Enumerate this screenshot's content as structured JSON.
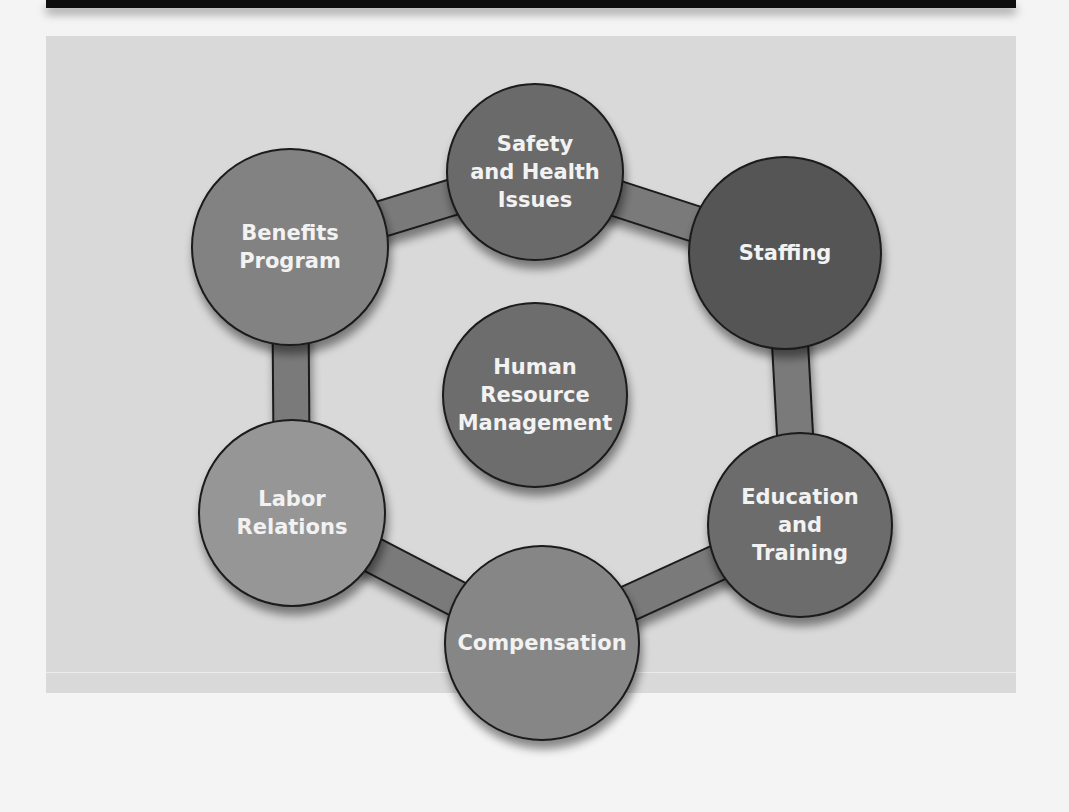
{
  "diagram": {
    "title": "",
    "center": {
      "id": "hrm",
      "label": "Human\nResource\nManagement",
      "cx": 535,
      "cy": 395,
      "r": 92,
      "fill": "#6d6d6d"
    },
    "nodes": [
      {
        "id": "safety",
        "label": "Safety\nand Health\nIssues",
        "cx": 535,
        "cy": 172,
        "r": 88,
        "fill": "#6a6a6a"
      },
      {
        "id": "staffing",
        "label": "Staffing",
        "cx": 785,
        "cy": 253,
        "r": 96,
        "fill": "#555555"
      },
      {
        "id": "education",
        "label": "Education\nand\nTraining",
        "cx": 800,
        "cy": 525,
        "r": 92,
        "fill": "#6c6c6c"
      },
      {
        "id": "compensation",
        "label": "Compensation",
        "cx": 542,
        "cy": 643,
        "r": 97,
        "fill": "#868686"
      },
      {
        "id": "labor",
        "label": "Labor\nRelations",
        "cx": 292,
        "cy": 513,
        "r": 93,
        "fill": "#969696"
      },
      {
        "id": "benefits",
        "label": "Benefits\nProgram",
        "cx": 290,
        "cy": 247,
        "r": 98,
        "fill": "#828282"
      }
    ],
    "ring": {
      "fill": "#7a7a7a",
      "stroke": "#1a1a1a",
      "width": 34
    },
    "colors": {
      "panel": "#d9d9d9",
      "header_bar": "#0e0e0e",
      "label_text": "#f2f2f2",
      "outline": "#1a1a1a"
    }
  }
}
